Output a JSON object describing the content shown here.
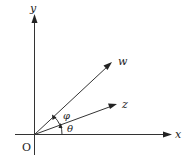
{
  "diagram": {
    "type": "complex-plane-vectors",
    "origin_label": "O",
    "axes": {
      "x_label": "x",
      "y_label": "y"
    },
    "vectors": [
      {
        "name": "w",
        "label": "w",
        "angle_deg": 40
      },
      {
        "name": "z",
        "label": "z",
        "angle_deg": 20
      }
    ],
    "angles": [
      {
        "name": "theta",
        "label": "θ",
        "from": "x-axis",
        "to": "z"
      },
      {
        "name": "phi",
        "label": "φ",
        "from": "z",
        "to": "w"
      }
    ],
    "colors": {
      "stroke": "#333333",
      "background": "#ffffff"
    }
  }
}
